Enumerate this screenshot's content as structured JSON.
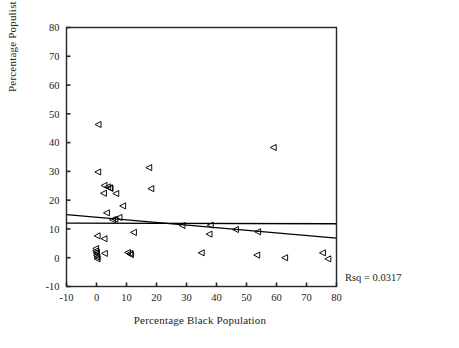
{
  "chart_data": {
    "type": "scatter",
    "title": "",
    "xlabel": "Percentage Black Population",
    "ylabel": "Percentage Populist Vote",
    "xlim": [
      -10,
      80
    ],
    "ylim": [
      -10,
      80
    ],
    "xticks": [
      -10,
      0,
      10,
      20,
      30,
      40,
      50,
      60,
      70,
      80
    ],
    "yticks": [
      -10,
      0,
      10,
      20,
      30,
      40,
      50,
      60,
      70,
      80
    ],
    "xtick_labels": [
      "-10",
      "0",
      "10",
      "20",
      "30",
      "40",
      "50",
      "60",
      "70",
      "80"
    ],
    "ytick_labels": [
      "-10",
      "0",
      "10",
      "20",
      "30",
      "40",
      "50",
      "60",
      "70",
      "80"
    ],
    "grid": false,
    "legend": null,
    "marker": "left-pointing-triangle",
    "marker_fill": "none",
    "marker_edge_color": "#000000",
    "points": [
      {
        "x": 0.6,
        "y": 46.3
      },
      {
        "x": 0.5,
        "y": 29.8
      },
      {
        "x": 17.5,
        "y": 31.3
      },
      {
        "x": 59.0,
        "y": 38.3
      },
      {
        "x": 2.6,
        "y": 25.1
      },
      {
        "x": 3.7,
        "y": 24.6
      },
      {
        "x": 4.4,
        "y": 24.3
      },
      {
        "x": 4.6,
        "y": 24.1
      },
      {
        "x": 2.4,
        "y": 22.4
      },
      {
        "x": 6.5,
        "y": 22.3
      },
      {
        "x": 18.2,
        "y": 24.0
      },
      {
        "x": 8.8,
        "y": 18.0
      },
      {
        "x": 3.4,
        "y": 15.6
      },
      {
        "x": 5.4,
        "y": 13.2
      },
      {
        "x": 6.2,
        "y": 13.4
      },
      {
        "x": 7.6,
        "y": 14.0
      },
      {
        "x": 0.3,
        "y": 7.6
      },
      {
        "x": 2.6,
        "y": 6.6
      },
      {
        "x": 12.4,
        "y": 8.8
      },
      {
        "x": 28.6,
        "y": 11.2
      },
      {
        "x": 38.0,
        "y": 11.3
      },
      {
        "x": 37.6,
        "y": 8.2
      },
      {
        "x": 46.4,
        "y": 9.8
      },
      {
        "x": 53.8,
        "y": 9.0
      },
      {
        "x": -0.2,
        "y": 3.2
      },
      {
        "x": -0.2,
        "y": 2.4
      },
      {
        "x": 0.0,
        "y": 1.9
      },
      {
        "x": 0.1,
        "y": 1.4
      },
      {
        "x": 0.1,
        "y": 0.8
      },
      {
        "x": 0.2,
        "y": 0.2
      },
      {
        "x": 0.3,
        "y": -0.4
      },
      {
        "x": 2.7,
        "y": 1.5
      },
      {
        "x": 10.4,
        "y": 1.8
      },
      {
        "x": 11.2,
        "y": 1.5
      },
      {
        "x": 11.4,
        "y": 1.1
      },
      {
        "x": 35.0,
        "y": 1.7
      },
      {
        "x": 53.5,
        "y": 0.9
      },
      {
        "x": 62.8,
        "y": 0.0
      },
      {
        "x": 75.4,
        "y": 1.7
      },
      {
        "x": 77.2,
        "y": -0.4
      }
    ],
    "regression_line": {
      "x0": -10,
      "y0": 15.0,
      "x1": 80,
      "y1": 6.8,
      "color": "#000000"
    },
    "reference_line": {
      "x0": -10,
      "y0": 12.0,
      "x1": 80,
      "y1": 11.8,
      "color": "#000000"
    },
    "annotation": {
      "text": "Rsq = 0.0317",
      "value": 0.0317,
      "label": "Rsq"
    }
  }
}
